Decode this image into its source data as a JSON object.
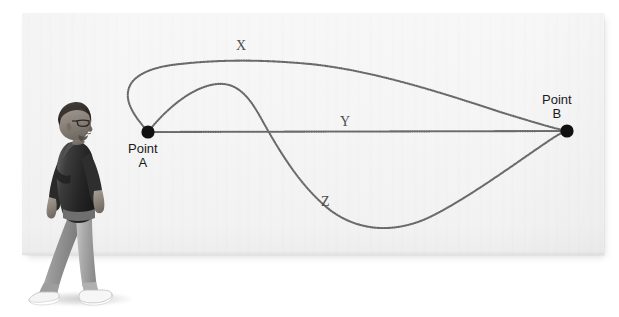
{
  "scene": {
    "type": "photograph-of-whiteboard-diagram",
    "background_color": "#ffffff",
    "board_color": "#f5f5f5"
  },
  "board": {
    "x": 22,
    "y": 13,
    "width": 582,
    "height": 242
  },
  "diagram": {
    "title": "",
    "nodes": [
      {
        "id": "A",
        "label_line1": "Point",
        "label_line2": "A",
        "x": 148,
        "y": 132,
        "radius": 6.5,
        "color": "#111111"
      },
      {
        "id": "B",
        "label_line1": "Point",
        "label_line2": "B",
        "x": 567,
        "y": 131,
        "radius": 6.5,
        "color": "#111111"
      }
    ],
    "paths": [
      {
        "id": "X",
        "label": "X",
        "label_x": 242,
        "label_y": 48,
        "description": "upper looping path from Point A arcing high over the board to Point B",
        "stroke_color": "#6e6e6e"
      },
      {
        "id": "Y",
        "label": "Y",
        "label_x": 345,
        "label_y": 123,
        "description": "straight horizontal path directly from Point A to Point B",
        "stroke_color": "#6e6e6e"
      },
      {
        "id": "Z",
        "label": "Z",
        "label_x": 327,
        "label_y": 203,
        "description": "path rising from Point A then dipping low beneath the straight line before rising to Point B",
        "stroke_color": "#6e6e6e"
      }
    ],
    "line_style": "dotted-beaded"
  },
  "person": {
    "description": "man walking left-to-right in profile",
    "attire": [
      "glasses",
      "dark short-sleeve t-shirt",
      "grey jeans",
      "white sneakers"
    ],
    "rendering": "grayscale photograph"
  }
}
